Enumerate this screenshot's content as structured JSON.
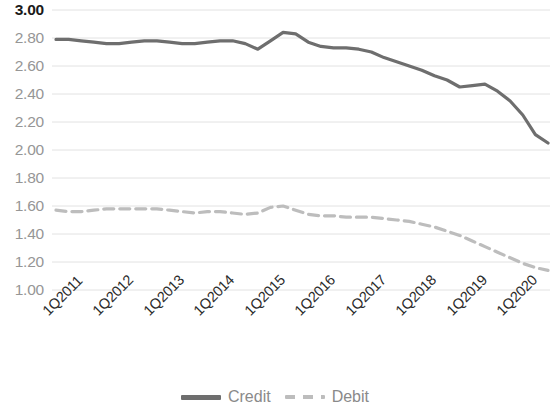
{
  "chart_data": {
    "type": "line",
    "title": "",
    "subtitle": "",
    "xlabel": "",
    "ylabel": "",
    "ylim": [
      1.0,
      3.0
    ],
    "y_ticks": [
      "3.00",
      "2.80",
      "2.60",
      "2.40",
      "2.20",
      "2.00",
      "1.80",
      "1.60",
      "1.40",
      "1.20",
      "1.00"
    ],
    "y_tick_values": [
      3.0,
      2.8,
      2.6,
      2.4,
      2.2,
      2.0,
      1.8,
      1.6,
      1.4,
      1.2,
      1.0
    ],
    "grid": true,
    "grid_axis": "y",
    "legend_position": "bottom",
    "x_tick_labels": [
      "1Q2011",
      "1Q2012",
      "1Q2013",
      "1Q2014",
      "1Q2015",
      "1Q2016",
      "1Q2017",
      "1Q2018",
      "1Q2019",
      "1Q2020"
    ],
    "x_tick_interval_quarters": 4,
    "x": [
      "1Q2011",
      "2Q2011",
      "3Q2011",
      "4Q2011",
      "1Q2012",
      "2Q2012",
      "3Q2012",
      "4Q2012",
      "1Q2013",
      "2Q2013",
      "3Q2013",
      "4Q2013",
      "1Q2014",
      "2Q2014",
      "3Q2014",
      "4Q2014",
      "1Q2015",
      "2Q2015",
      "3Q2015",
      "4Q2015",
      "1Q2016",
      "2Q2016",
      "3Q2016",
      "4Q2016",
      "1Q2017",
      "2Q2017",
      "3Q2017",
      "4Q2017",
      "1Q2018",
      "2Q2018",
      "3Q2018",
      "4Q2018",
      "1Q2019",
      "2Q2019",
      "3Q2019",
      "4Q2019",
      "1Q2020",
      "2Q2020",
      "3Q2020",
      "4Q2020"
    ],
    "series": [
      {
        "name": "Credit",
        "color": "#6e6e6e",
        "style": "solid",
        "width": 3.2,
        "values": [
          2.79,
          2.79,
          2.78,
          2.77,
          2.76,
          2.76,
          2.77,
          2.78,
          2.78,
          2.77,
          2.76,
          2.76,
          2.77,
          2.78,
          2.78,
          2.76,
          2.72,
          2.78,
          2.84,
          2.83,
          2.77,
          2.74,
          2.73,
          2.73,
          2.72,
          2.7,
          2.66,
          2.63,
          2.6,
          2.57,
          2.53,
          2.5,
          2.45,
          2.46,
          2.47,
          2.42,
          2.35,
          2.25,
          2.11,
          2.05
        ]
      },
      {
        "name": "Debit",
        "color": "#bdbdbd",
        "style": "dashed",
        "width": 3.2,
        "values": [
          1.57,
          1.56,
          1.56,
          1.57,
          1.58,
          1.58,
          1.58,
          1.58,
          1.58,
          1.57,
          1.56,
          1.55,
          1.56,
          1.56,
          1.55,
          1.54,
          1.55,
          1.59,
          1.6,
          1.57,
          1.54,
          1.53,
          1.53,
          1.52,
          1.52,
          1.52,
          1.51,
          1.5,
          1.49,
          1.47,
          1.45,
          1.42,
          1.39,
          1.35,
          1.31,
          1.27,
          1.23,
          1.19,
          1.16,
          1.14
        ]
      }
    ]
  },
  "legend": {
    "items": [
      {
        "label": "Credit"
      },
      {
        "label": "Debit"
      }
    ]
  }
}
